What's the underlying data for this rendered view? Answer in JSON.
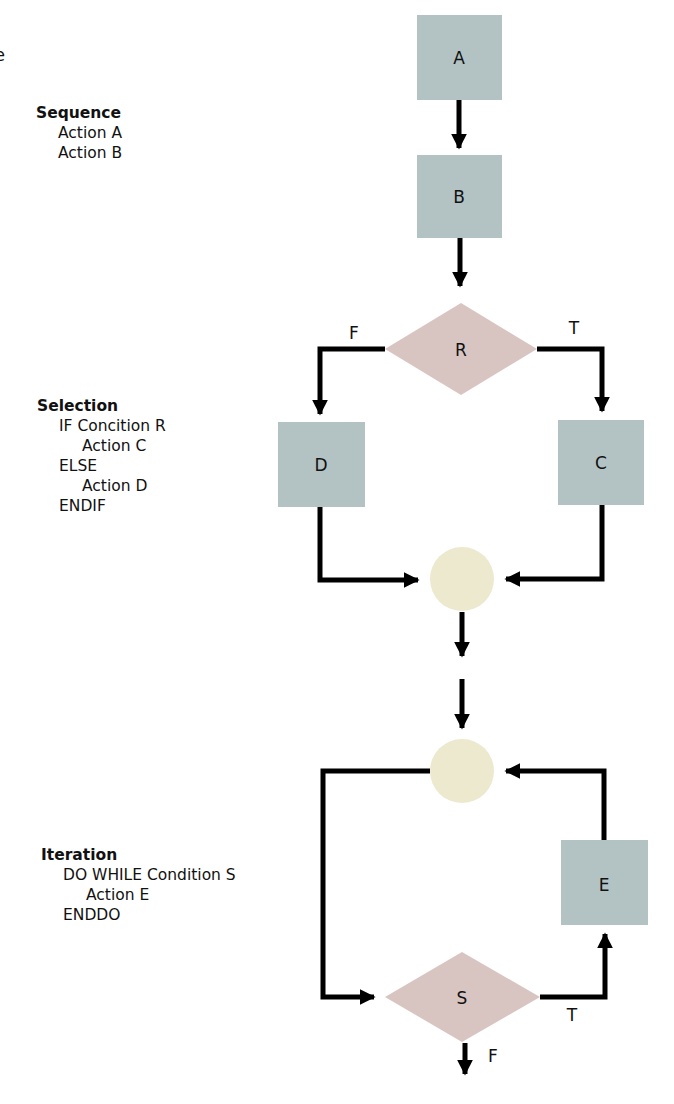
{
  "fragment": "e",
  "colors": {
    "process": "#b3c3c4",
    "decision": "#d8c5c2",
    "connector": "#ece9cf",
    "line": "#000000"
  },
  "sequence": {
    "title": "Sequence",
    "lines": [
      "Action A",
      "Action B"
    ]
  },
  "selection": {
    "title": "Selection",
    "lines": [
      "IF Concition R",
      "Action C",
      "ELSE",
      "Action D",
      "ENDIF"
    ]
  },
  "iteration": {
    "title": "Iteration",
    "lines": [
      "DO WHILE Condition S",
      "Action E",
      "ENDDO"
    ]
  },
  "nodes": {
    "A": "A",
    "B": "B",
    "R": "R",
    "C": "C",
    "D": "D",
    "E": "E",
    "S": "S"
  },
  "edge_labels": {
    "r_false": "F",
    "r_true": "T",
    "s_true": "T",
    "s_false": "F"
  }
}
